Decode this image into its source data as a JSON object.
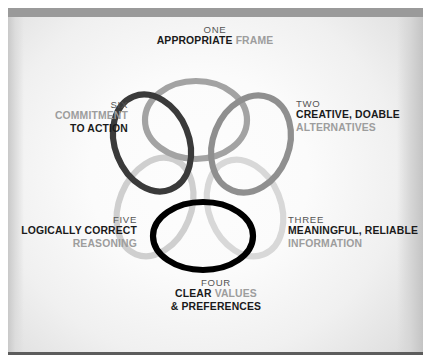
{
  "diagram": {
    "background_colors": {
      "plate_light": "#fdfdfd",
      "plate_edge": "#d2d2d2",
      "top_band": "#9a9a9a",
      "bottom_rule": "#5c5c5c"
    },
    "labels": [
      {
        "id": "one",
        "number": "ONE",
        "lines": [
          {
            "segments": [
              {
                "text": "APPROPRIATE ",
                "tone": "dark"
              },
              {
                "text": "FRAME",
                "tone": "gray"
              }
            ]
          }
        ],
        "align": "center",
        "ring_color": "#a3a3a3"
      },
      {
        "id": "two",
        "number": "TWO",
        "lines": [
          {
            "segments": [
              {
                "text": "CREATIVE, DOABLE",
                "tone": "dark"
              }
            ]
          },
          {
            "segments": [
              {
                "text": "ALTERNATIVES",
                "tone": "gray"
              }
            ]
          }
        ],
        "align": "right",
        "ring_color": "#8f8f8f"
      },
      {
        "id": "three",
        "number": "THREE",
        "lines": [
          {
            "segments": [
              {
                "text": "MEANINGFUL, RELIABLE",
                "tone": "dark"
              }
            ]
          },
          {
            "segments": [
              {
                "text": "INFORMATION",
                "tone": "gray"
              }
            ]
          }
        ],
        "align": "right",
        "ring_color": "#d8d8d8"
      },
      {
        "id": "four",
        "number": "FOUR",
        "lines": [
          {
            "segments": [
              {
                "text": "CLEAR ",
                "tone": "dark"
              },
              {
                "text": "VALUES",
                "tone": "gray"
              }
            ]
          },
          {
            "segments": [
              {
                "text": "& PREFERENCES",
                "tone": "dark"
              }
            ]
          }
        ],
        "align": "center",
        "ring_color": "#000000"
      },
      {
        "id": "five",
        "number": "FIVE",
        "lines": [
          {
            "segments": [
              {
                "text": "LOGICALLY CORRECT",
                "tone": "dark"
              }
            ]
          },
          {
            "segments": [
              {
                "text": "REASONING",
                "tone": "gray"
              }
            ]
          }
        ],
        "align": "left",
        "ring_color": "#cfcfcf"
      },
      {
        "id": "six",
        "number": "SIX",
        "lines": [
          {
            "segments": [
              {
                "text": "COMMITMENT",
                "tone": "gray"
              }
            ]
          },
          {
            "segments": [
              {
                "text": "TO ACTION",
                "tone": "dark"
              }
            ]
          }
        ],
        "align": "left",
        "ring_color": "#3a3a3a"
      }
    ],
    "rings": [
      {
        "id": "ring-one",
        "label": "ONE",
        "cx": 196,
        "cy": 120,
        "rx": 51,
        "ry": 39,
        "rotate": 0,
        "color": "#a3a3a3",
        "width": 6.2
      },
      {
        "id": "ring-two",
        "label": "TWO",
        "cx": 251,
        "cy": 144,
        "rx": 38,
        "ry": 50,
        "rotate": 22,
        "color": "#8f8f8f",
        "width": 6.2
      },
      {
        "id": "ring-three",
        "label": "THREE",
        "cx": 245,
        "cy": 208,
        "rx": 36,
        "ry": 50,
        "rotate": -22,
        "color": "#d8d8d8",
        "width": 6.2
      },
      {
        "id": "ring-four",
        "label": "FOUR",
        "cx": 203,
        "cy": 236,
        "rx": 50,
        "ry": 34,
        "rotate": 0,
        "color": "#000000",
        "width": 6.2
      },
      {
        "id": "ring-five",
        "label": "FIVE",
        "cx": 155,
        "cy": 207,
        "rx": 36,
        "ry": 51,
        "rotate": 22,
        "color": "#cfcfcf",
        "width": 6.2
      },
      {
        "id": "ring-six",
        "label": "SIX",
        "cx": 152,
        "cy": 143,
        "rx": 37,
        "ry": 50,
        "rotate": -22,
        "color": "#3a3a3a",
        "width": 6.2
      }
    ]
  }
}
